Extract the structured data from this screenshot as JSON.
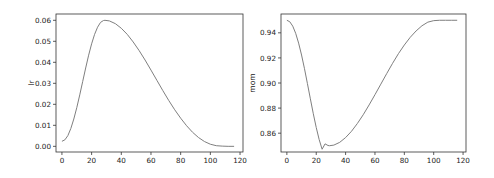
{
  "chart_data": [
    {
      "type": "line",
      "title": "",
      "xlabel": "",
      "ylabel": "lr",
      "xlim": [
        -4,
        122
      ],
      "ylim": [
        -0.0027,
        0.063
      ],
      "xticks": [
        0,
        20,
        40,
        60,
        80,
        100,
        120
      ],
      "xtick_labels": [
        "0",
        "20",
        "40",
        "60",
        "80",
        "100",
        "120"
      ],
      "yticks": [
        0.0,
        0.01,
        0.02,
        0.03,
        0.04,
        0.05,
        0.06
      ],
      "ytick_labels": [
        "0.00",
        "0.01",
        "0.02",
        "0.03",
        "0.04",
        "0.05",
        "0.06"
      ],
      "grid": false,
      "series": [
        {
          "name": "lr",
          "color": "#7f7f7f",
          "x": [
            0,
            2,
            4,
            6,
            8,
            10,
            12,
            14,
            16,
            18,
            20,
            22,
            24,
            26,
            28,
            29,
            32,
            36,
            40,
            44,
            48,
            52,
            56,
            60,
            64,
            68,
            72,
            76,
            80,
            84,
            88,
            92,
            96,
            100,
            104,
            108,
            112,
            116
          ],
          "y": [
            0.0024,
            0.0031,
            0.0051,
            0.0085,
            0.013,
            0.0184,
            0.0245,
            0.0309,
            0.0373,
            0.0434,
            0.0488,
            0.0533,
            0.0567,
            0.059,
            0.0599,
            0.06,
            0.0597,
            0.0584,
            0.0562,
            0.0533,
            0.0497,
            0.0456,
            0.0411,
            0.0363,
            0.0314,
            0.0265,
            0.0218,
            0.0174,
            0.0134,
            0.0098,
            0.0067,
            0.0042,
            0.0023,
            0.001,
            0.0003,
            0.0001,
            0.0,
            0.0
          ]
        }
      ]
    },
    {
      "type": "line",
      "title": "",
      "xlabel": "",
      "ylabel": "mom",
      "xlim": [
        -4,
        122
      ],
      "ylim": [
        0.845,
        0.955
      ],
      "xticks": [
        0,
        20,
        40,
        60,
        80,
        100,
        120
      ],
      "xtick_labels": [
        "0",
        "20",
        "40",
        "60",
        "80",
        "100",
        "120"
      ],
      "yticks": [
        0.86,
        0.88,
        0.9,
        0.92,
        0.94
      ],
      "ytick_labels": [
        "0.86",
        "0.88",
        "0.90",
        "0.92",
        "0.94"
      ],
      "grid": false,
      "series": [
        {
          "name": "mom",
          "color": "#7f7f7f",
          "x": [
            0,
            2,
            4,
            6,
            8,
            10,
            12,
            14,
            16,
            18,
            20,
            22,
            24,
            26,
            28,
            29,
            32,
            36,
            40,
            44,
            48,
            52,
            56,
            60,
            64,
            68,
            72,
            76,
            80,
            84,
            88,
            92,
            96,
            100,
            104,
            108,
            112,
            116
          ],
          "y": [
            0.95,
            0.9488,
            0.9453,
            0.9396,
            0.9318,
            0.9223,
            0.9114,
            0.8995,
            0.8874,
            0.8755,
            0.8645,
            0.8549,
            0.8472,
            0.8515,
            0.8502,
            0.85,
            0.8505,
            0.8527,
            0.8565,
            0.8615,
            0.8677,
            0.8747,
            0.8825,
            0.8907,
            0.8991,
            0.9075,
            0.9157,
            0.9234,
            0.9303,
            0.9364,
            0.9415,
            0.9456,
            0.9485,
            0.9497,
            0.95,
            0.95,
            0.95,
            0.95
          ]
        }
      ]
    }
  ]
}
